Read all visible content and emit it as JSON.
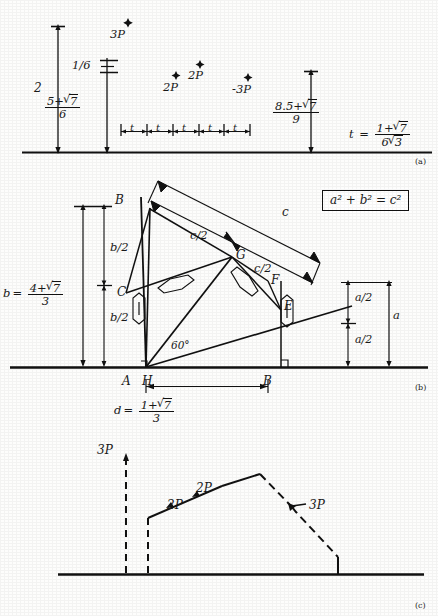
{
  "figure": {
    "panels": [
      {
        "id": "a",
        "label": "(a)"
      },
      {
        "id": "b",
        "label": "(b)"
      },
      {
        "id": "c",
        "label": "(c)"
      }
    ]
  },
  "panel_a": {
    "axis_label_2": "2",
    "frac_one_sixth": {
      "num": "1",
      "den": "6",
      "inline": "1/6"
    },
    "frac_left": {
      "num_plain": "5+",
      "radicand": "7",
      "den": "6"
    },
    "frac_right": {
      "num_plain": "8.5+",
      "radicand": "7",
      "den": "9"
    },
    "t_definition": {
      "lhs": "t",
      "eq": "=",
      "num_plain": "1+",
      "num_radicand": "7",
      "den_prefix": "6",
      "den_radicand": "3"
    },
    "force_points": [
      {
        "label": "3P",
        "x": 128,
        "y": 33
      },
      {
        "label": "2P",
        "x": 172,
        "y": 86
      },
      {
        "label": "2P",
        "x": 196,
        "y": 75
      },
      {
        "label": "-3P",
        "x": 245,
        "y": 88
      }
    ],
    "ruler_segments": [
      "t",
      "t",
      "t",
      "t",
      "t"
    ]
  },
  "panel_b": {
    "equation_box": "a² + b² = c²",
    "vertices": [
      {
        "name": "B",
        "x": 118,
        "y": 205
      },
      {
        "name": "C",
        "x": 125,
        "y": 293
      },
      {
        "name": "G",
        "x": 229,
        "y": 255
      },
      {
        "name": "F",
        "x": 264,
        "y": 283
      },
      {
        "name": "E",
        "x": 280,
        "y": 308
      },
      {
        "name": "A",
        "x": 126,
        "y": 378
      },
      {
        "name": "H",
        "x": 145,
        "y": 378
      },
      {
        "name": "B",
        "x": 267,
        "y": 378
      }
    ],
    "dim_c": "c",
    "dim_c_half_upper": "c/2",
    "dim_c_half_lower": "c/2",
    "angle_60": "60°",
    "b_half_upper": "b/2",
    "b_half_lower": "b/2",
    "a_half_upper": "a/2",
    "a_half_lower": "a/2",
    "a_total": "a",
    "b_definition": {
      "lhs": "b",
      "eq": "=",
      "num_plain": "4+",
      "radicand": "7",
      "den": "3"
    },
    "d_definition": {
      "lhs": "d",
      "eq": "=",
      "num_plain": "1+",
      "radicand": "7",
      "den": "3"
    }
  },
  "panel_c": {
    "load_labels": [
      {
        "label": "3P",
        "x": 104,
        "y": 449
      },
      {
        "label": "2P",
        "x": 196,
        "y": 505
      },
      {
        "label": "2P",
        "x": 227,
        "y": 489
      },
      {
        "label": "3P",
        "x": 300,
        "y": 509
      }
    ]
  },
  "colors": {
    "ink": "#111111",
    "paper": "#fdfdfc",
    "rule": "#000000"
  }
}
